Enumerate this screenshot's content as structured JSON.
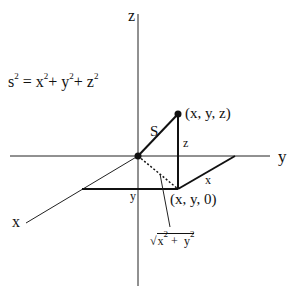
{
  "diagram": {
    "equation": {
      "lhs": "s",
      "exp": "2",
      "eq": "=",
      "x": "x",
      "y": "y",
      "z": "z",
      "plus": "+"
    },
    "axes": {
      "z": "z",
      "y": "y",
      "x": "x"
    },
    "labels": {
      "point_xyz": "(x, y, z)",
      "point_xy0": "(x, y, 0)",
      "s": "S",
      "z_len": "z",
      "x_len": "x",
      "y_len": "y",
      "sqrt_expr": {
        "sym": "√",
        "x": "x",
        "y": "y",
        "exp": "2",
        "plus": "+"
      }
    }
  }
}
